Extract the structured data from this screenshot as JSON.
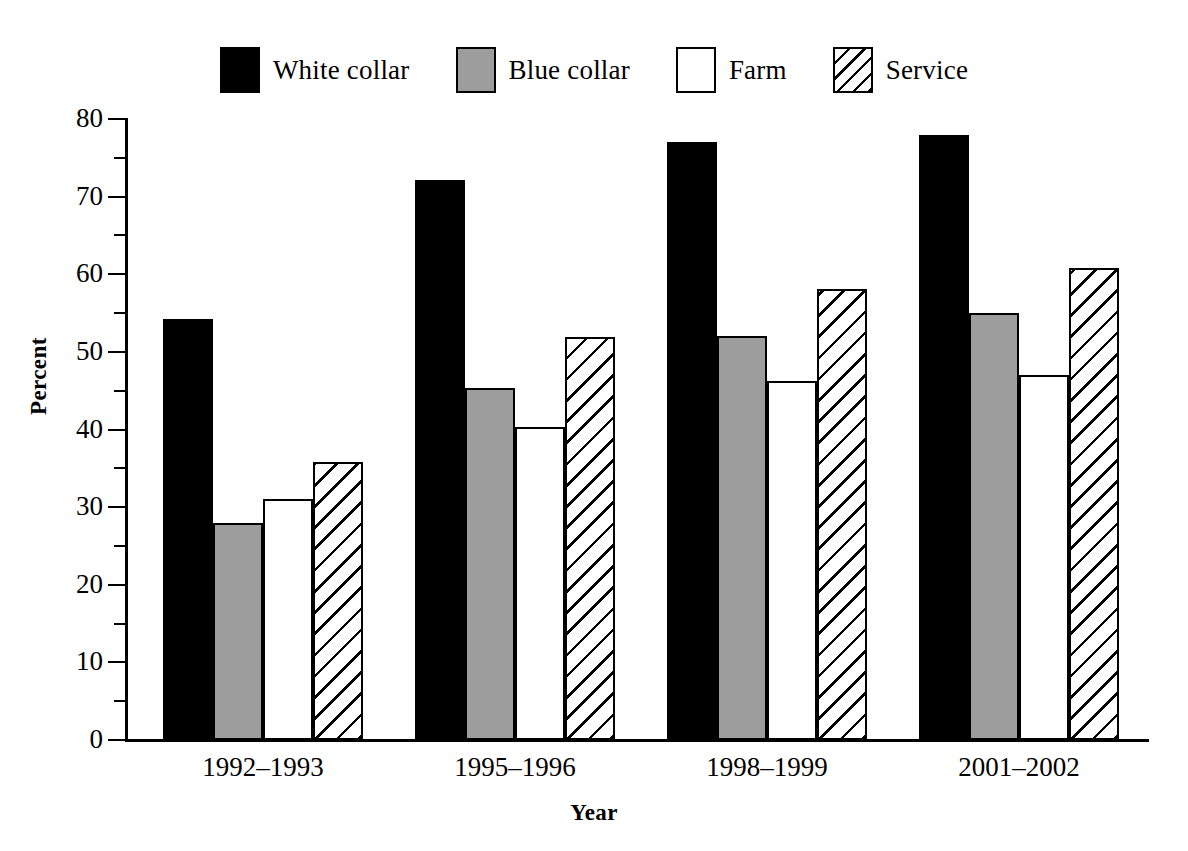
{
  "chart_data": {
    "type": "bar",
    "title": "",
    "subtitle": "",
    "xlabel": "Year",
    "ylabel": "Percent",
    "categories": [
      "1992–1993",
      "1995–1996",
      "1998–1999",
      "2001–2002"
    ],
    "series": [
      {
        "name": "White collar",
        "fill": "black",
        "values": [
          54.3,
          72.2,
          77.0,
          78.0
        ]
      },
      {
        "name": "Blue collar",
        "fill": "gray",
        "values": [
          27.9,
          45.3,
          52.0,
          55.0
        ]
      },
      {
        "name": "Farm",
        "fill": "white",
        "values": [
          31.0,
          40.3,
          46.2,
          47.0
        ]
      },
      {
        "name": "Service",
        "fill": "hatch",
        "values": [
          35.8,
          51.9,
          58.1,
          60.8
        ]
      }
    ],
    "ylim": [
      0,
      80
    ],
    "ytick_major": [
      0,
      10,
      20,
      30,
      40,
      50,
      60,
      70,
      80
    ],
    "ytick_minor": [
      5,
      15,
      25,
      35,
      45,
      55,
      65,
      75
    ],
    "ytick_labels": [
      "0",
      "10",
      "20",
      "30",
      "40",
      "50",
      "60",
      "70",
      "80"
    ],
    "grid": false,
    "legend_position": "top",
    "legend_entries": [
      "White collar",
      "Blue collar",
      "Farm",
      "Service"
    ],
    "colors": {
      "black": "#000000",
      "gray": "#9d9d9d",
      "white": "#ffffff",
      "hatch_line": "#000000",
      "axis": "#000000",
      "background": "#ffffff"
    }
  }
}
